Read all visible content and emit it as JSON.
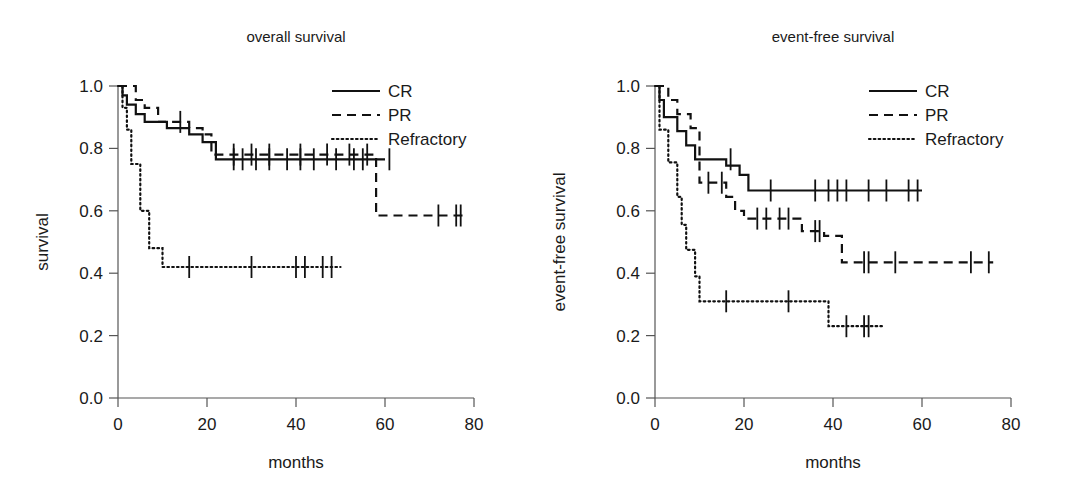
{
  "figure": {
    "background": "#ffffff",
    "ink": "#111111",
    "axis_color": "#555555"
  },
  "panels": [
    {
      "id": "overall-survival",
      "title": "overall survival",
      "xlabel": "months",
      "ylabel": "survival"
    },
    {
      "id": "event-free-survival",
      "title": "event-free survival",
      "xlabel": "months",
      "ylabel": "event-free survival"
    }
  ],
  "legend": {
    "entries": [
      {
        "label": "CR",
        "style": "solid"
      },
      {
        "label": "PR",
        "style": "dashed"
      },
      {
        "label": "Refractory",
        "style": "dotted"
      }
    ]
  },
  "chart_data": [
    {
      "type": "line",
      "subtype": "kaplan-meier-step",
      "title": "overall survival",
      "xlabel": "months",
      "ylabel": "survival",
      "xlim": [
        0,
        80
      ],
      "ylim": [
        0.0,
        1.0
      ],
      "xticks": [
        0,
        20,
        40,
        60,
        80
      ],
      "yticks": [
        0.0,
        0.2,
        0.4,
        0.6,
        0.8,
        1.0
      ],
      "xtick_labels": [
        "0",
        "20",
        "40",
        "60",
        "80"
      ],
      "ytick_labels": [
        "0.0",
        "0.2",
        "0.4",
        "0.6",
        "0.8",
        "1.0"
      ],
      "grid": false,
      "legend_position": "top-right",
      "series": [
        {
          "name": "CR",
          "style": "solid",
          "points": [
            [
              0,
              1.0
            ],
            [
              1,
              1.0
            ],
            [
              1,
              0.97
            ],
            [
              2,
              0.97
            ],
            [
              2,
              0.94
            ],
            [
              4,
              0.94
            ],
            [
              4,
              0.91
            ],
            [
              6,
              0.91
            ],
            [
              6,
              0.885
            ],
            [
              11,
              0.885
            ],
            [
              11,
              0.865
            ],
            [
              16,
              0.865
            ],
            [
              16,
              0.845
            ],
            [
              19,
              0.845
            ],
            [
              19,
              0.82
            ],
            [
              22,
              0.82
            ],
            [
              22,
              0.765
            ],
            [
              60,
              0.765
            ]
          ],
          "censored": [
            [
              26,
              0.765
            ],
            [
              28,
              0.765
            ],
            [
              31,
              0.765
            ],
            [
              34,
              0.765
            ],
            [
              38,
              0.765
            ],
            [
              41,
              0.765
            ],
            [
              44,
              0.765
            ],
            [
              49,
              0.765
            ],
            [
              53,
              0.765
            ],
            [
              55,
              0.765
            ],
            [
              61,
              0.765
            ]
          ]
        },
        {
          "name": "PR",
          "style": "dashed",
          "points": [
            [
              0,
              1.0
            ],
            [
              4,
              1.0
            ],
            [
              4,
              0.955
            ],
            [
              6,
              0.955
            ],
            [
              6,
              0.93
            ],
            [
              9,
              0.93
            ],
            [
              9,
              0.885
            ],
            [
              16,
              0.885
            ],
            [
              16,
              0.865
            ],
            [
              19,
              0.865
            ],
            [
              19,
              0.845
            ],
            [
              21,
              0.845
            ],
            [
              21,
              0.78
            ],
            [
              58,
              0.78
            ],
            [
              58,
              0.585
            ],
            [
              78,
              0.585
            ]
          ],
          "censored": [
            [
              14,
              0.885
            ],
            [
              26,
              0.78
            ],
            [
              30,
              0.78
            ],
            [
              34,
              0.78
            ],
            [
              41,
              0.78
            ],
            [
              47,
              0.78
            ],
            [
              52,
              0.78
            ],
            [
              56,
              0.78
            ],
            [
              72,
              0.585
            ],
            [
              76,
              0.585
            ],
            [
              77,
              0.585
            ]
          ]
        },
        {
          "name": "Refractory",
          "style": "dotted",
          "points": [
            [
              0,
              1.0
            ],
            [
              1,
              1.0
            ],
            [
              1,
              0.93
            ],
            [
              2,
              0.93
            ],
            [
              2,
              0.86
            ],
            [
              3,
              0.86
            ],
            [
              3,
              0.75
            ],
            [
              5,
              0.75
            ],
            [
              5,
              0.6
            ],
            [
              7,
              0.6
            ],
            [
              7,
              0.48
            ],
            [
              10,
              0.48
            ],
            [
              10,
              0.42
            ],
            [
              50,
              0.42
            ]
          ],
          "censored": [
            [
              16,
              0.42
            ],
            [
              30,
              0.42
            ],
            [
              40,
              0.42
            ],
            [
              42,
              0.42
            ],
            [
              46,
              0.42
            ],
            [
              48,
              0.42
            ]
          ]
        }
      ]
    },
    {
      "type": "line",
      "subtype": "kaplan-meier-step",
      "title": "event-free survival",
      "xlabel": "months",
      "ylabel": "event-free survival",
      "xlim": [
        0,
        80
      ],
      "ylim": [
        0.0,
        1.0
      ],
      "xticks": [
        0,
        20,
        40,
        60,
        80
      ],
      "yticks": [
        0.0,
        0.2,
        0.4,
        0.6,
        0.8,
        1.0
      ],
      "xtick_labels": [
        "0",
        "20",
        "40",
        "60",
        "80"
      ],
      "ytick_labels": [
        "0.0",
        "0.2",
        "0.4",
        "0.6",
        "0.8",
        "1.0"
      ],
      "grid": false,
      "legend_position": "top-right",
      "series": [
        {
          "name": "CR",
          "style": "solid",
          "points": [
            [
              0,
              1.0
            ],
            [
              1,
              1.0
            ],
            [
              1,
              0.955
            ],
            [
              2,
              0.955
            ],
            [
              2,
              0.9
            ],
            [
              5,
              0.9
            ],
            [
              5,
              0.855
            ],
            [
              7,
              0.855
            ],
            [
              7,
              0.81
            ],
            [
              9,
              0.81
            ],
            [
              9,
              0.765
            ],
            [
              16,
              0.765
            ],
            [
              16,
              0.745
            ],
            [
              19,
              0.745
            ],
            [
              19,
              0.715
            ],
            [
              21,
              0.715
            ],
            [
              21,
              0.665
            ],
            [
              60,
              0.665
            ]
          ],
          "censored": [
            [
              17,
              0.765
            ],
            [
              26,
              0.665
            ],
            [
              36,
              0.665
            ],
            [
              39,
              0.665
            ],
            [
              41,
              0.665
            ],
            [
              43,
              0.665
            ],
            [
              48,
              0.665
            ],
            [
              52,
              0.665
            ],
            [
              57,
              0.665
            ],
            [
              59,
              0.665
            ]
          ]
        },
        {
          "name": "PR",
          "style": "dashed",
          "points": [
            [
              0,
              1.0
            ],
            [
              3,
              1.0
            ],
            [
              3,
              0.955
            ],
            [
              5,
              0.955
            ],
            [
              5,
              0.91
            ],
            [
              8,
              0.91
            ],
            [
              8,
              0.865
            ],
            [
              10,
              0.865
            ],
            [
              10,
              0.69
            ],
            [
              16,
              0.69
            ],
            [
              16,
              0.645
            ],
            [
              18,
              0.645
            ],
            [
              18,
              0.6
            ],
            [
              20,
              0.6
            ],
            [
              20,
              0.575
            ],
            [
              33,
              0.575
            ],
            [
              33,
              0.535
            ],
            [
              38,
              0.535
            ],
            [
              38,
              0.52
            ],
            [
              42,
              0.52
            ],
            [
              42,
              0.435
            ],
            [
              76,
              0.435
            ]
          ],
          "censored": [
            [
              12,
              0.69
            ],
            [
              15,
              0.69
            ],
            [
              23,
              0.575
            ],
            [
              25,
              0.575
            ],
            [
              28,
              0.575
            ],
            [
              30,
              0.575
            ],
            [
              36,
              0.535
            ],
            [
              37,
              0.535
            ],
            [
              47,
              0.435
            ],
            [
              48,
              0.435
            ],
            [
              54,
              0.435
            ],
            [
              71,
              0.435
            ],
            [
              75,
              0.435
            ]
          ]
        },
        {
          "name": "Refractory",
          "style": "dotted",
          "points": [
            [
              0,
              1.0
            ],
            [
              1,
              1.0
            ],
            [
              1,
              0.86
            ],
            [
              3,
              0.86
            ],
            [
              3,
              0.755
            ],
            [
              5,
              0.755
            ],
            [
              5,
              0.645
            ],
            [
              6,
              0.645
            ],
            [
              6,
              0.555
            ],
            [
              7,
              0.555
            ],
            [
              7,
              0.475
            ],
            [
              9,
              0.475
            ],
            [
              9,
              0.39
            ],
            [
              10,
              0.39
            ],
            [
              10,
              0.31
            ],
            [
              39,
              0.31
            ],
            [
              39,
              0.23
            ],
            [
              51,
              0.23
            ]
          ],
          "censored": [
            [
              16,
              0.31
            ],
            [
              30,
              0.31
            ],
            [
              43,
              0.23
            ],
            [
              47,
              0.23
            ],
            [
              48,
              0.23
            ]
          ]
        }
      ]
    }
  ]
}
